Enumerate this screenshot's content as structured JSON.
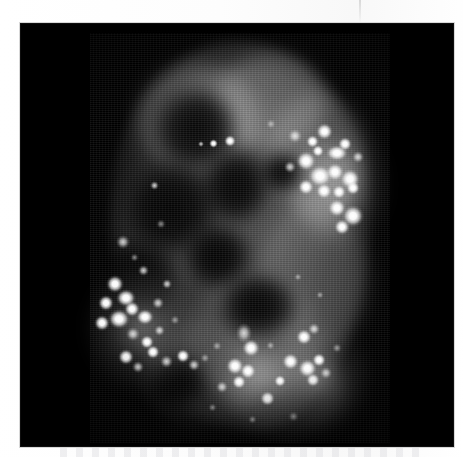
{
  "figure": {
    "kind": "fluorescence-micrograph",
    "caption": "",
    "panel_label": "",
    "scale_bar_label": "",
    "background_color": "#ffffff",
    "panel_color": "#000000",
    "signal_color": "#ffffff",
    "panel": {
      "x": 20,
      "y": 23,
      "width": 434,
      "height": 424
    }
  },
  "image_content": {
    "specimen": "cell nucleus",
    "channel": "grayscale",
    "nucleus": {
      "center_x": 220,
      "center_y": 213,
      "width": 260,
      "height": 390,
      "mean_intensity": 58
    },
    "nucleoli": [
      {
        "x": 175,
        "y": 105,
        "r": 46,
        "intensity": 8
      },
      {
        "x": 150,
        "y": 185,
        "r": 52,
        "intensity": 6
      },
      {
        "x": 215,
        "y": 160,
        "r": 34,
        "intensity": 10
      },
      {
        "x": 118,
        "y": 255,
        "r": 40,
        "intensity": 9
      },
      {
        "x": 196,
        "y": 230,
        "r": 30,
        "intensity": 12
      }
    ],
    "foci_clusters": [
      {
        "name": "upper-right-cluster",
        "x": 305,
        "y": 150,
        "count": 18,
        "peak_intensity": 255
      },
      {
        "name": "left-cluster",
        "x": 110,
        "y": 290,
        "count": 16,
        "peak_intensity": 240
      },
      {
        "name": "lower-mid-cluster",
        "x": 235,
        "y": 335,
        "count": 10,
        "peak_intensity": 250
      },
      {
        "name": "lower-right-cluster",
        "x": 290,
        "y": 350,
        "count": 8,
        "peak_intensity": 248
      },
      {
        "name": "scattered-upper",
        "x": 200,
        "y": 118,
        "count": 4,
        "peak_intensity": 190
      }
    ],
    "total_foci_estimate": 56
  },
  "annotations": {
    "top_margin_seam": true,
    "bottom_margin_smudge": true,
    "scanlines": true
  }
}
